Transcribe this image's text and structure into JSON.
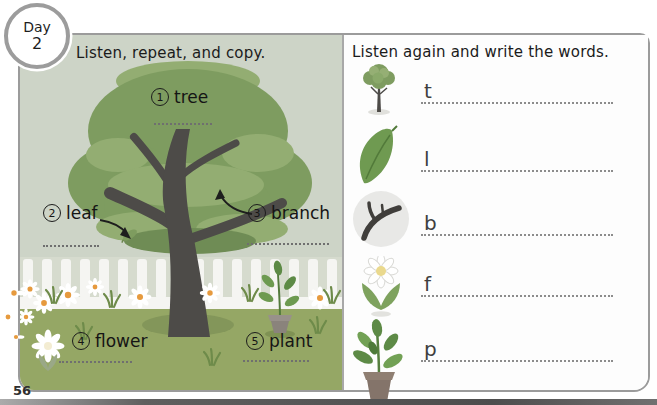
{
  "day_badge": {
    "label": "Day",
    "number": "2"
  },
  "left_panel": {
    "title": "Listen, repeat, and copy.",
    "labels": [
      {
        "num": "1",
        "word": "tree"
      },
      {
        "num": "2",
        "word": "leaf"
      },
      {
        "num": "3",
        "word": "branch"
      },
      {
        "num": "4",
        "word": "flower"
      },
      {
        "num": "5",
        "word": "plant"
      }
    ]
  },
  "right_panel": {
    "title": "Listen again and write the words.",
    "rows": [
      {
        "icon": "tree-icon",
        "letter": "t"
      },
      {
        "icon": "leaf-icon",
        "letter": "l"
      },
      {
        "icon": "branch-icon",
        "letter": "b"
      },
      {
        "icon": "flower-icon",
        "letter": "f"
      },
      {
        "icon": "plant-icon",
        "letter": "p"
      }
    ]
  },
  "page_number": "56",
  "colors": {
    "scene_sky": "#cdd4c7",
    "foliage": "#7e9c60",
    "foliage_light": "#93ad72",
    "trunk": "#4d4b48",
    "grass": "#95a765",
    "fence": "#f5f5f2",
    "panel_border": "#9b9b9b"
  }
}
